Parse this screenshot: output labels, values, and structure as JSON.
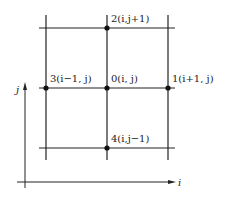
{
  "diagram": {
    "type": "five-point finite-difference stencil grid",
    "nodes": [
      {
        "id": "0",
        "label": "0(i, j)"
      },
      {
        "id": "1",
        "label": "1(i+1, j)"
      },
      {
        "id": "2",
        "label": "2(i,j+1)"
      },
      {
        "id": "3",
        "label": "3(i−1, j)"
      },
      {
        "id": "4",
        "label": "4(i,j−1)"
      }
    ],
    "axes": {
      "x_label": "i",
      "y_label": "j"
    },
    "colors": {
      "line": "#222222",
      "background": "#ffffff"
    }
  }
}
